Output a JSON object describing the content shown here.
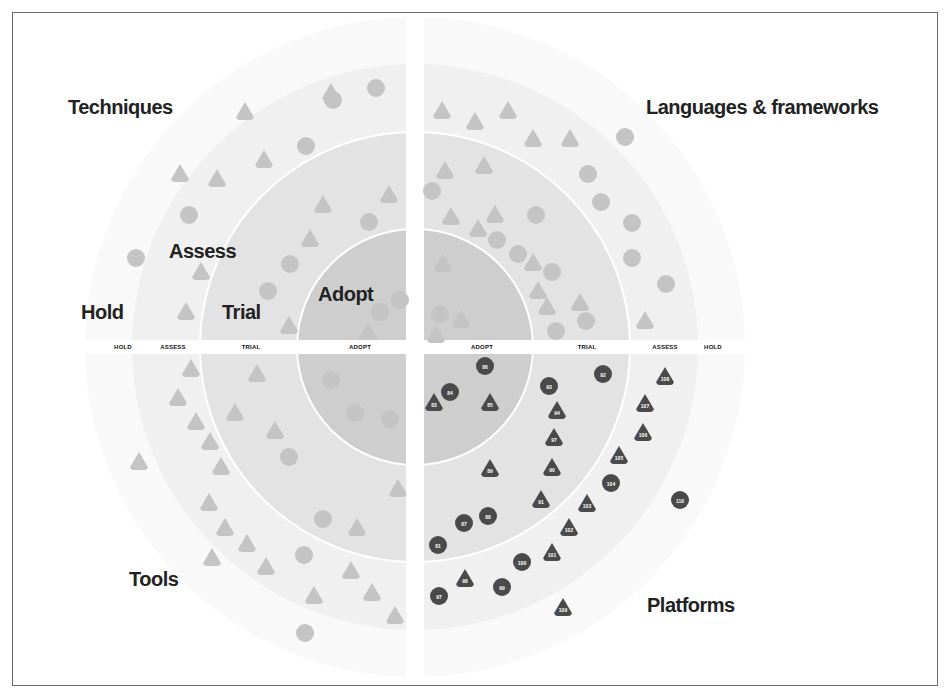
{
  "quadrants": {
    "top_left": "Techniques",
    "top_right": "Languages & frameworks",
    "bottom_left": "Tools",
    "bottom_right": "Platforms"
  },
  "ring_labels": {
    "hold": "Hold",
    "assess": "Assess",
    "trial": "Trial",
    "adopt": "Adopt"
  },
  "axis_labels": {
    "left": [
      "HOLD",
      "ASSESS",
      "TRIAL",
      "ADOPT"
    ],
    "right": [
      "ADOPT",
      "TRIAL",
      "ASSESS",
      "HOLD"
    ]
  },
  "colors": {
    "adopt_ring": "#cdcdcd",
    "trial_ring": "#e2e2e2",
    "assess_ring": "#efefef",
    "hold_ring": "#f8f8f8",
    "faded_blip": "#c4c4c4",
    "highlight_blip": "#4a4a4a",
    "divider": "#ffffff"
  },
  "blips": [
    {
      "x": 331,
      "y": 92,
      "shape": "triangle",
      "tone": "faded",
      "label": ""
    },
    {
      "x": 376,
      "y": 88,
      "shape": "circle",
      "tone": "faded",
      "label": ""
    },
    {
      "x": 333,
      "y": 100,
      "shape": "circle",
      "tone": "faded",
      "label": ""
    },
    {
      "x": 245,
      "y": 111,
      "shape": "triangle",
      "tone": "faded",
      "label": ""
    },
    {
      "x": 306,
      "y": 146,
      "shape": "circle",
      "tone": "faded",
      "label": ""
    },
    {
      "x": 264,
      "y": 159,
      "shape": "triangle",
      "tone": "faded",
      "label": ""
    },
    {
      "x": 180,
      "y": 173,
      "shape": "triangle",
      "tone": "faded",
      "label": ""
    },
    {
      "x": 217,
      "y": 178,
      "shape": "triangle",
      "tone": "faded",
      "label": ""
    },
    {
      "x": 189,
      "y": 215,
      "shape": "circle",
      "tone": "faded",
      "label": ""
    },
    {
      "x": 323,
      "y": 204,
      "shape": "triangle",
      "tone": "faded",
      "label": ""
    },
    {
      "x": 389,
      "y": 194,
      "shape": "triangle",
      "tone": "faded",
      "label": ""
    },
    {
      "x": 369,
      "y": 222,
      "shape": "circle",
      "tone": "faded",
      "label": ""
    },
    {
      "x": 310,
      "y": 238,
      "shape": "triangle",
      "tone": "faded",
      "label": ""
    },
    {
      "x": 136,
      "y": 258,
      "shape": "circle",
      "tone": "faded",
      "label": ""
    },
    {
      "x": 201,
      "y": 271,
      "shape": "triangle",
      "tone": "faded",
      "label": ""
    },
    {
      "x": 290,
      "y": 264,
      "shape": "circle",
      "tone": "faded",
      "label": ""
    },
    {
      "x": 268,
      "y": 291,
      "shape": "circle",
      "tone": "faded",
      "label": ""
    },
    {
      "x": 186,
      "y": 311,
      "shape": "triangle",
      "tone": "faded",
      "label": ""
    },
    {
      "x": 289,
      "y": 325,
      "shape": "triangle",
      "tone": "faded",
      "label": ""
    },
    {
      "x": 400,
      "y": 300,
      "shape": "circle",
      "tone": "faded",
      "label": ""
    },
    {
      "x": 380,
      "y": 312,
      "shape": "circle",
      "tone": "faded",
      "label": ""
    },
    {
      "x": 368,
      "y": 331,
      "shape": "triangle",
      "tone": "faded",
      "label": ""
    },
    {
      "x": 442,
      "y": 110,
      "shape": "triangle",
      "tone": "faded",
      "label": ""
    },
    {
      "x": 475,
      "y": 121,
      "shape": "triangle",
      "tone": "faded",
      "label": ""
    },
    {
      "x": 508,
      "y": 110,
      "shape": "triangle",
      "tone": "faded",
      "label": ""
    },
    {
      "x": 533,
      "y": 138,
      "shape": "triangle",
      "tone": "faded",
      "label": ""
    },
    {
      "x": 570,
      "y": 138,
      "shape": "triangle",
      "tone": "faded",
      "label": ""
    },
    {
      "x": 625,
      "y": 137,
      "shape": "circle",
      "tone": "faded",
      "label": ""
    },
    {
      "x": 445,
      "y": 170,
      "shape": "triangle",
      "tone": "faded",
      "label": ""
    },
    {
      "x": 484,
      "y": 165,
      "shape": "triangle",
      "tone": "faded",
      "label": ""
    },
    {
      "x": 588,
      "y": 174,
      "shape": "circle",
      "tone": "faded",
      "label": ""
    },
    {
      "x": 432,
      "y": 191,
      "shape": "circle",
      "tone": "faded",
      "label": ""
    },
    {
      "x": 601,
      "y": 202,
      "shape": "circle",
      "tone": "faded",
      "label": ""
    },
    {
      "x": 451,
      "y": 216,
      "shape": "triangle",
      "tone": "faded",
      "label": ""
    },
    {
      "x": 495,
      "y": 214,
      "shape": "triangle",
      "tone": "faded",
      "label": ""
    },
    {
      "x": 536,
      "y": 215,
      "shape": "circle",
      "tone": "faded",
      "label": ""
    },
    {
      "x": 478,
      "y": 228,
      "shape": "triangle",
      "tone": "faded",
      "label": ""
    },
    {
      "x": 497,
      "y": 240,
      "shape": "circle",
      "tone": "faded",
      "label": ""
    },
    {
      "x": 632,
      "y": 223,
      "shape": "circle",
      "tone": "faded",
      "label": ""
    },
    {
      "x": 518,
      "y": 254,
      "shape": "circle",
      "tone": "faded",
      "label": ""
    },
    {
      "x": 533,
      "y": 262,
      "shape": "triangle",
      "tone": "faded",
      "label": ""
    },
    {
      "x": 552,
      "y": 272,
      "shape": "circle",
      "tone": "faded",
      "label": ""
    },
    {
      "x": 632,
      "y": 258,
      "shape": "circle",
      "tone": "faded",
      "label": ""
    },
    {
      "x": 443,
      "y": 263,
      "shape": "triangle",
      "tone": "faded",
      "label": ""
    },
    {
      "x": 538,
      "y": 290,
      "shape": "triangle",
      "tone": "faded",
      "label": ""
    },
    {
      "x": 666,
      "y": 284,
      "shape": "circle",
      "tone": "faded",
      "label": ""
    },
    {
      "x": 547,
      "y": 306,
      "shape": "triangle",
      "tone": "faded",
      "label": ""
    },
    {
      "x": 580,
      "y": 302,
      "shape": "triangle",
      "tone": "faded",
      "label": ""
    },
    {
      "x": 586,
      "y": 321,
      "shape": "circle",
      "tone": "faded",
      "label": ""
    },
    {
      "x": 440,
      "y": 314,
      "shape": "circle",
      "tone": "faded",
      "label": ""
    },
    {
      "x": 461,
      "y": 319,
      "shape": "triangle",
      "tone": "faded",
      "label": ""
    },
    {
      "x": 436,
      "y": 334,
      "shape": "triangle",
      "tone": "faded",
      "label": ""
    },
    {
      "x": 556,
      "y": 331,
      "shape": "circle",
      "tone": "faded",
      "label": ""
    },
    {
      "x": 645,
      "y": 320,
      "shape": "triangle",
      "tone": "faded",
      "label": ""
    },
    {
      "x": 191,
      "y": 368,
      "shape": "triangle",
      "tone": "faded",
      "label": ""
    },
    {
      "x": 257,
      "y": 373,
      "shape": "triangle",
      "tone": "faded",
      "label": ""
    },
    {
      "x": 178,
      "y": 397,
      "shape": "triangle",
      "tone": "faded",
      "label": ""
    },
    {
      "x": 196,
      "y": 421,
      "shape": "triangle",
      "tone": "faded",
      "label": ""
    },
    {
      "x": 235,
      "y": 412,
      "shape": "triangle",
      "tone": "faded",
      "label": ""
    },
    {
      "x": 275,
      "y": 430,
      "shape": "triangle",
      "tone": "faded",
      "label": ""
    },
    {
      "x": 210,
      "y": 441,
      "shape": "triangle",
      "tone": "faded",
      "label": ""
    },
    {
      "x": 289,
      "y": 457,
      "shape": "circle",
      "tone": "faded",
      "label": ""
    },
    {
      "x": 139,
      "y": 461,
      "shape": "triangle",
      "tone": "faded",
      "label": ""
    },
    {
      "x": 221,
      "y": 466,
      "shape": "triangle",
      "tone": "faded",
      "label": ""
    },
    {
      "x": 331,
      "y": 380,
      "shape": "circle",
      "tone": "faded",
      "label": ""
    },
    {
      "x": 355,
      "y": 413,
      "shape": "circle",
      "tone": "faded",
      "label": ""
    },
    {
      "x": 390,
      "y": 419,
      "shape": "circle",
      "tone": "faded",
      "label": ""
    },
    {
      "x": 398,
      "y": 488,
      "shape": "triangle",
      "tone": "faded",
      "label": ""
    },
    {
      "x": 209,
      "y": 502,
      "shape": "triangle",
      "tone": "faded",
      "label": ""
    },
    {
      "x": 323,
      "y": 519,
      "shape": "circle",
      "tone": "faded",
      "label": ""
    },
    {
      "x": 357,
      "y": 527,
      "shape": "triangle",
      "tone": "faded",
      "label": ""
    },
    {
      "x": 225,
      "y": 527,
      "shape": "triangle",
      "tone": "faded",
      "label": ""
    },
    {
      "x": 247,
      "y": 543,
      "shape": "triangle",
      "tone": "faded",
      "label": ""
    },
    {
      "x": 212,
      "y": 557,
      "shape": "triangle",
      "tone": "faded",
      "label": ""
    },
    {
      "x": 304,
      "y": 555,
      "shape": "circle",
      "tone": "faded",
      "label": ""
    },
    {
      "x": 266,
      "y": 566,
      "shape": "triangle",
      "tone": "faded",
      "label": ""
    },
    {
      "x": 351,
      "y": 570,
      "shape": "triangle",
      "tone": "faded",
      "label": ""
    },
    {
      "x": 372,
      "y": 592,
      "shape": "triangle",
      "tone": "faded",
      "label": ""
    },
    {
      "x": 314,
      "y": 595,
      "shape": "triangle",
      "tone": "faded",
      "label": ""
    },
    {
      "x": 395,
      "y": 615,
      "shape": "triangle",
      "tone": "faded",
      "label": ""
    },
    {
      "x": 305,
      "y": 633,
      "shape": "circle",
      "tone": "faded",
      "label": ""
    },
    {
      "x": 485,
      "y": 366,
      "shape": "circle",
      "tone": "dark",
      "label": "86"
    },
    {
      "x": 450,
      "y": 392,
      "shape": "circle",
      "tone": "dark",
      "label": "84"
    },
    {
      "x": 434,
      "y": 402,
      "shape": "triangle",
      "tone": "dark",
      "label": "83"
    },
    {
      "x": 490,
      "y": 402,
      "shape": "triangle",
      "tone": "dark",
      "label": "85"
    },
    {
      "x": 549,
      "y": 386,
      "shape": "circle",
      "tone": "dark",
      "label": "93"
    },
    {
      "x": 603,
      "y": 374,
      "shape": "circle",
      "tone": "dark",
      "label": "92"
    },
    {
      "x": 665,
      "y": 376,
      "shape": "triangle",
      "tone": "dark",
      "label": "108"
    },
    {
      "x": 557,
      "y": 410,
      "shape": "triangle",
      "tone": "dark",
      "label": "94"
    },
    {
      "x": 645,
      "y": 403,
      "shape": "triangle",
      "tone": "dark",
      "label": "107"
    },
    {
      "x": 554,
      "y": 437,
      "shape": "triangle",
      "tone": "dark",
      "label": "97"
    },
    {
      "x": 643,
      "y": 432,
      "shape": "triangle",
      "tone": "dark",
      "label": "106"
    },
    {
      "x": 619,
      "y": 455,
      "shape": "triangle",
      "tone": "dark",
      "label": "105"
    },
    {
      "x": 490,
      "y": 468,
      "shape": "triangle",
      "tone": "dark",
      "label": "89"
    },
    {
      "x": 552,
      "y": 467,
      "shape": "triangle",
      "tone": "dark",
      "label": "90"
    },
    {
      "x": 611,
      "y": 483,
      "shape": "circle",
      "tone": "dark",
      "label": "104"
    },
    {
      "x": 541,
      "y": 499,
      "shape": "triangle",
      "tone": "dark",
      "label": "91"
    },
    {
      "x": 587,
      "y": 503,
      "shape": "triangle",
      "tone": "dark",
      "label": "103"
    },
    {
      "x": 680,
      "y": 500,
      "shape": "circle",
      "tone": "dark",
      "label": "110"
    },
    {
      "x": 488,
      "y": 516,
      "shape": "circle",
      "tone": "dark",
      "label": "88"
    },
    {
      "x": 464,
      "y": 523,
      "shape": "circle",
      "tone": "dark",
      "label": "87"
    },
    {
      "x": 569,
      "y": 527,
      "shape": "triangle",
      "tone": "dark",
      "label": "102"
    },
    {
      "x": 438,
      "y": 545,
      "shape": "circle",
      "tone": "dark",
      "label": "81"
    },
    {
      "x": 552,
      "y": 552,
      "shape": "triangle",
      "tone": "dark",
      "label": "101"
    },
    {
      "x": 522,
      "y": 562,
      "shape": "circle",
      "tone": "dark",
      "label": "100"
    },
    {
      "x": 465,
      "y": 578,
      "shape": "triangle",
      "tone": "dark",
      "label": "98"
    },
    {
      "x": 502,
      "y": 587,
      "shape": "circle",
      "tone": "dark",
      "label": "99"
    },
    {
      "x": 439,
      "y": 596,
      "shape": "circle",
      "tone": "dark",
      "label": "97"
    },
    {
      "x": 563,
      "y": 607,
      "shape": "triangle",
      "tone": "dark",
      "label": "109"
    }
  ]
}
